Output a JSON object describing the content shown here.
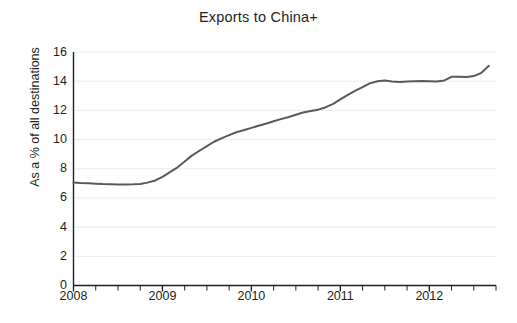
{
  "chart_data": {
    "type": "line",
    "title": "Exports to China+",
    "xlabel": "",
    "ylabel": "As a % of all destinations",
    "ylim": [
      0,
      16
    ],
    "xlim": [
      2008.0,
      2012.75
    ],
    "yticks": [
      0,
      2,
      4,
      6,
      8,
      10,
      12,
      14,
      16
    ],
    "ytick_labels": [
      "0",
      "2",
      "4",
      "6",
      "8",
      "10",
      "12",
      "14",
      "16"
    ],
    "xticks": [
      2008,
      2009,
      2010,
      2011,
      2012
    ],
    "xtick_labels": [
      "2008",
      "2009",
      "2010",
      "2011",
      "2012"
    ],
    "minor_xticks_per_year": 4,
    "grid": "horizontal",
    "legend": null,
    "line_color": "#595959",
    "line_width": 2.0,
    "series": [
      {
        "name": "Exports to China+",
        "x": [
          2008.0,
          2008.08,
          2008.17,
          2008.25,
          2008.33,
          2008.42,
          2008.5,
          2008.58,
          2008.67,
          2008.75,
          2008.83,
          2008.92,
          2009.0,
          2009.08,
          2009.17,
          2009.25,
          2009.33,
          2009.42,
          2009.5,
          2009.58,
          2009.67,
          2009.75,
          2009.83,
          2009.92,
          2010.0,
          2010.08,
          2010.17,
          2010.25,
          2010.33,
          2010.42,
          2010.5,
          2010.58,
          2010.67,
          2010.75,
          2010.83,
          2010.92,
          2011.0,
          2011.08,
          2011.17,
          2011.25,
          2011.33,
          2011.42,
          2011.5,
          2011.58,
          2011.67,
          2011.75,
          2011.83,
          2011.92,
          2012.0,
          2012.08,
          2012.17,
          2012.25,
          2012.33,
          2012.42,
          2012.5,
          2012.58,
          2012.67
        ],
        "y": [
          7.05,
          7.02,
          7.0,
          6.98,
          6.95,
          6.93,
          6.92,
          6.92,
          6.93,
          6.96,
          7.05,
          7.2,
          7.45,
          7.75,
          8.1,
          8.5,
          8.9,
          9.25,
          9.55,
          9.85,
          10.1,
          10.3,
          10.5,
          10.65,
          10.8,
          10.95,
          11.1,
          11.25,
          11.4,
          11.55,
          11.7,
          11.85,
          11.95,
          12.05,
          12.2,
          12.45,
          12.75,
          13.05,
          13.35,
          13.6,
          13.85,
          14.0,
          14.05,
          13.98,
          13.95,
          13.98,
          14.0,
          14.02,
          14.0,
          13.98,
          14.05,
          14.3,
          14.3,
          14.28,
          14.35,
          14.55,
          15.05
        ]
      }
    ]
  },
  "axes": {
    "title": "Exports to China+",
    "ylabel": "As a % of all destinations"
  }
}
